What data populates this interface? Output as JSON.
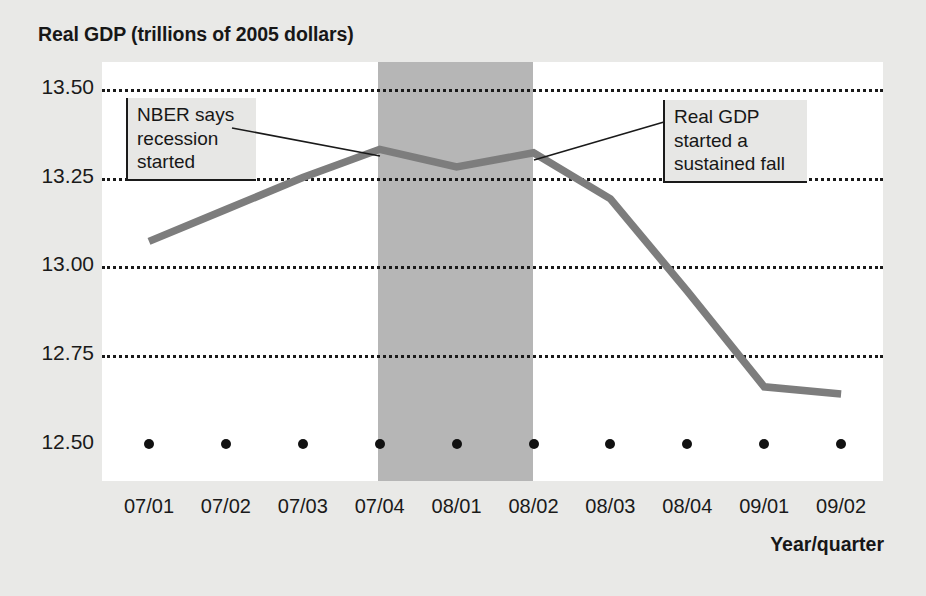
{
  "chart_data": {
    "type": "line",
    "title": "Real GDP (trillions of 2005 dollars)",
    "xlabel": "Year/quarter",
    "ylabel": "Real GDP (trillions of 2005 dollars)",
    "categories": [
      "07/01",
      "07/02",
      "07/03",
      "07/04",
      "08/01",
      "08/02",
      "08/03",
      "08/04",
      "09/01",
      "09/02"
    ],
    "values": [
      13.07,
      13.16,
      13.25,
      13.33,
      13.28,
      13.32,
      13.19,
      12.93,
      12.66,
      12.64
    ],
    "series": [
      {
        "name": "Real GDP",
        "values": [
          13.07,
          13.16,
          13.25,
          13.33,
          13.28,
          13.32,
          13.19,
          12.93,
          12.66,
          12.64
        ]
      }
    ],
    "ylim": [
      12.5,
      13.5
    ],
    "ytick_labels": [
      "13.50",
      "13.25",
      "13.00",
      "12.75",
      "12.50"
    ],
    "ytick_values": [
      13.5,
      13.25,
      13.0,
      12.75,
      12.5
    ],
    "grid": true,
    "gridline_style": "dotted",
    "legend": "none",
    "shaded_region": {
      "label": "recession",
      "from": "07/04",
      "to": "08/02",
      "color": "#b6b6b6"
    },
    "annotations": [
      {
        "id": "nber",
        "text": "NBER says\nrecession\nstarted",
        "points_to": "07/04"
      },
      {
        "id": "fall",
        "text": "Real GDP\nstarted a\nsustained fall",
        "points_to": "08/02"
      }
    ],
    "colors": {
      "line": "#7d7d7d",
      "grid": "#1a1a1a",
      "plot_background": "#ffffff",
      "figure_background": "#e9e9e7",
      "recession_band": "#b6b6b6",
      "text": "#171717"
    }
  },
  "title": {
    "text": "Real GDP (trillions of 2005 dollars)"
  },
  "y_axis": {
    "ticks": [
      {
        "label": "13.50"
      },
      {
        "label": "13.25"
      },
      {
        "label": "13.00"
      },
      {
        "label": "12.75"
      },
      {
        "label": "12.50"
      }
    ]
  },
  "x_axis": {
    "title": "Year/quarter",
    "ticks": [
      {
        "label": "07/01"
      },
      {
        "label": "07/02"
      },
      {
        "label": "07/03"
      },
      {
        "label": "07/04"
      },
      {
        "label": "08/01"
      },
      {
        "label": "08/02"
      },
      {
        "label": "08/03"
      },
      {
        "label": "08/04"
      },
      {
        "label": "09/01"
      },
      {
        "label": "09/02"
      }
    ]
  },
  "annotations": {
    "nber": {
      "text": "NBER says\nrecession\nstarted"
    },
    "fall": {
      "text": "Real GDP\nstarted a\nsustained fall"
    }
  }
}
